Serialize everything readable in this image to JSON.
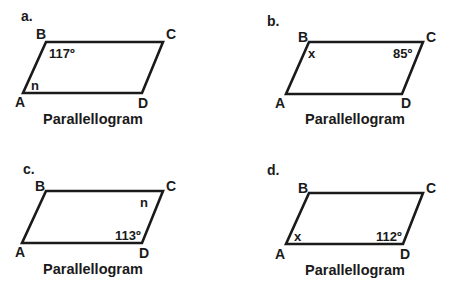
{
  "figures": [
    {
      "id": "a",
      "panel_label": "a.",
      "caption": "Parallellogram",
      "vertices": {
        "A": "A",
        "B": "B",
        "C": "C",
        "D": "D"
      },
      "angle_labels": {
        "B": "117º",
        "A": "n"
      }
    },
    {
      "id": "b",
      "panel_label": "b.",
      "caption": "Parallellogram",
      "vertices": {
        "A": "A",
        "B": "B",
        "C": "C",
        "D": "D"
      },
      "angle_labels": {
        "B": "x",
        "C": "85º"
      }
    },
    {
      "id": "c",
      "panel_label": "c.",
      "caption": "Parallellogram",
      "vertices": {
        "A": "A",
        "B": "B",
        "C": "C",
        "D": "D"
      },
      "angle_labels": {
        "C": "n",
        "D": "113º"
      }
    },
    {
      "id": "d",
      "panel_label": "d.",
      "caption": "Parallellogram",
      "vertices": {
        "A": "A",
        "B": "B",
        "C": "C",
        "D": "D"
      },
      "angle_labels": {
        "A": "x",
        "D": "112º"
      }
    }
  ],
  "colors": {
    "stroke": "#1a1a1a",
    "background": "#ffffff"
  }
}
